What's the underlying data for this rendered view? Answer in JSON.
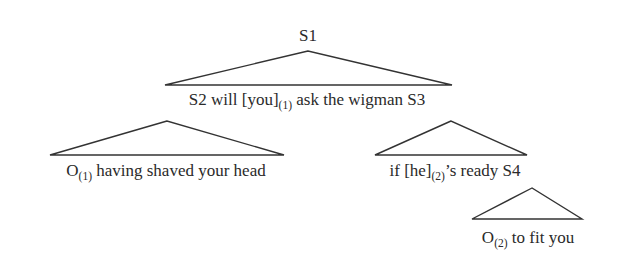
{
  "diagram": {
    "type": "syntax-tree",
    "nodes": {
      "root": {
        "label": "S1"
      },
      "level1": {
        "part1": "S2 will [you]",
        "index1": "(1)",
        "part2": " ask the wigman S3"
      },
      "left_child": {
        "part1": "O",
        "index1": "(1)",
        "part2": " having shaved your head"
      },
      "right_child": {
        "part1": "if [he]",
        "index1": "(2)",
        "part2": "’s ready S4"
      },
      "leaf": {
        "part1": "O",
        "index1": "(2)",
        "part2": " to fit you"
      }
    },
    "edges": [
      {
        "from": "S1",
        "to": "S2 will [you](1) ask the wigman S3",
        "shape": "triangle"
      },
      {
        "from": "S2",
        "to": "O(1) having shaved your head",
        "shape": "triangle"
      },
      {
        "from": "S3",
        "to": "if [he](2)'s ready S4",
        "shape": "triangle"
      },
      {
        "from": "S4",
        "to": "O(2) to fit you",
        "shape": "triangle"
      }
    ],
    "colors": {
      "line": "#333333",
      "text": "#2a2a2a",
      "background": "#ffffff"
    }
  }
}
